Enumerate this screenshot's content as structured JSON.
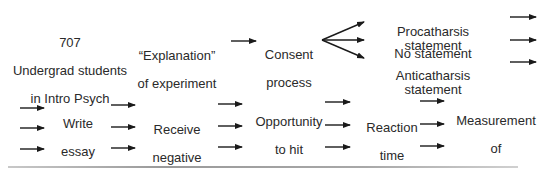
{
  "diagram": {
    "type": "flowchart",
    "row1": {
      "participants": {
        "count": "707",
        "line1": "Undergrad students",
        "line2": "in Intro Psych"
      },
      "explanation": {
        "line1": "“Explanation”",
        "line2": "of experiment"
      },
      "consent": {
        "line1": "Consent",
        "line2": "process"
      },
      "conditions": [
        {
          "label": "Procatharsis statement"
        },
        {
          "label": "No statement"
        },
        {
          "label": "Anticatharsis statement"
        }
      ]
    },
    "row2": {
      "steps": [
        {
          "lines": [
            "Write",
            "essay",
            "on",
            "abortion"
          ]
        },
        {
          "lines": [
            "Receive",
            "negative",
            "evaluations"
          ]
        },
        {
          "lines": [
            "Opportunity",
            "to hit",
            "punching",
            "bag"
          ]
        },
        {
          "lines": [
            "Reaction",
            "time",
            "test"
          ]
        },
        {
          "lines": [
            "Measurement",
            "of",
            "aggressiveness",
            "in response"
          ]
        }
      ]
    },
    "arrow_color": "#1a1a1a"
  }
}
